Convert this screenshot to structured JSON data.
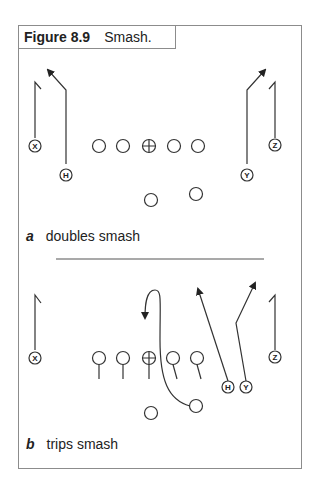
{
  "figure": {
    "number": "Figure 8.9",
    "title": "Smash."
  },
  "diagrams": [
    {
      "letter": "a",
      "caption": "doubles smash",
      "players": [
        "X",
        "H",
        "Y",
        "Z"
      ]
    },
    {
      "letter": "b",
      "caption": "trips smash",
      "players": [
        "X",
        "H",
        "Y",
        "Z"
      ]
    }
  ]
}
